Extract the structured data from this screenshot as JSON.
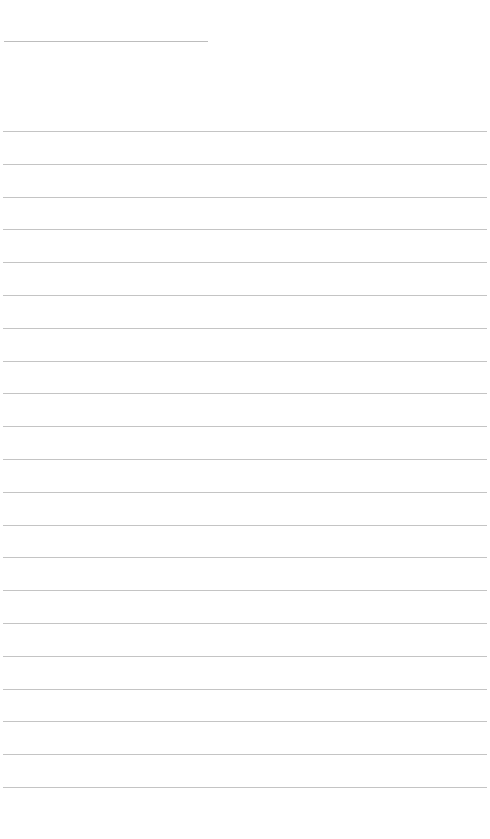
{
  "page": {
    "type": "blank lined sheet",
    "background_color": "#ffffff",
    "line_color": "#c4c4c4"
  },
  "title_line": {
    "label": "",
    "value": ""
  },
  "rules": {
    "count": 21,
    "first_y": 131,
    "spacing": 32.8,
    "lines": [
      "",
      "",
      "",
      "",
      "",
      "",
      "",
      "",
      "",
      "",
      "",
      "",
      "",
      "",
      "",
      "",
      "",
      "",
      "",
      "",
      ""
    ]
  }
}
